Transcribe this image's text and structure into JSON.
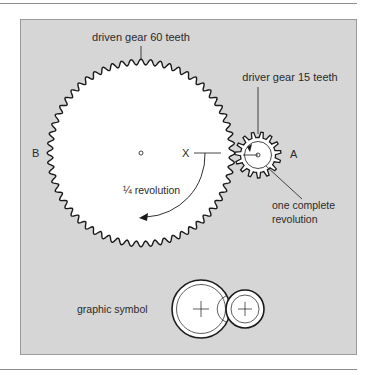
{
  "diagram": {
    "colors": {
      "panel": "#d6d6d6",
      "panel_border": "#9a9a9a",
      "ink": "#1a1a1a",
      "rule": "#8c8c8c",
      "gear_fill": "#ffffff"
    },
    "labels": {
      "driven_gear": "driven gear 60 teeth",
      "driver_gear": "driver gear 15 teeth",
      "point_a": "A",
      "point_b": "B",
      "point_x": "X",
      "quarter_revolution": "¼ revolution",
      "one_complete_line1": "one complete",
      "one_complete_line2": "revolution",
      "graphic_symbol": "graphic symbol"
    },
    "driven_gear": {
      "teeth": 60
    },
    "driver_gear": {
      "teeth": 15
    }
  }
}
